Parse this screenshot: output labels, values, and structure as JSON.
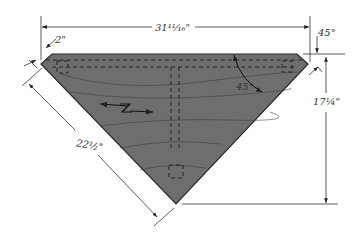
{
  "diagram": {
    "colors": {
      "wood": "#6e6e6e",
      "wood_edge": "#2a2a2a",
      "grain": "#3e3e3e",
      "line": "#333333",
      "background": "#ffffff"
    },
    "dimensions": {
      "top_width": "31¹¹⁄₁₆\"",
      "left_edge": "22½\"",
      "height": "17¼\"",
      "corner_offset": "2\"",
      "corner_angle": "45°",
      "edge_angle": "45°"
    },
    "annotations": {
      "grain_direction": "grain-direction-arrow"
    }
  }
}
